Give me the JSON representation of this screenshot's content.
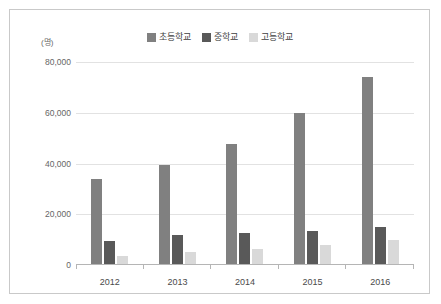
{
  "chart_data": {
    "type": "bar",
    "title": "",
    "subtitle": "",
    "xlabel": "",
    "ylabel": "(명)",
    "unit_label": "(명)",
    "categories": [
      "2012",
      "2013",
      "2014",
      "2015",
      "2016"
    ],
    "series": [
      {
        "name": "초등학교",
        "color": "#808080",
        "values": [
          34000,
          39500,
          47500,
          60000,
          74000
        ]
      },
      {
        "name": "중학교",
        "color": "#595959",
        "values": [
          9500,
          12000,
          12800,
          13500,
          15000
        ]
      },
      {
        "name": "고등학교",
        "color": "#d9d9d9",
        "values": [
          3500,
          5200,
          6500,
          8000,
          9700
        ]
      }
    ],
    "ylim": [
      0,
      80000
    ],
    "yticks": [
      0,
      20000,
      40000,
      60000,
      80000
    ],
    "ytick_labels": [
      "0",
      "20,000",
      "40,000",
      "60,000",
      "80,000"
    ],
    "grid": true,
    "legend_position": "top-center"
  },
  "frame": {
    "border_color": "#c9c9c9",
    "background": "#ffffff"
  }
}
